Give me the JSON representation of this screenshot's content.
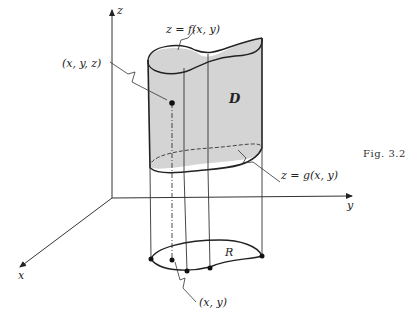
{
  "figure": {
    "caption": "Fig. 3.2",
    "axes": {
      "x_label": "x",
      "y_label": "y",
      "z_label": "z"
    },
    "region_label": "D",
    "base_region_label": "R",
    "top_surface_label": "z = f(x, y)",
    "bottom_surface_label": "z = g(x, y)",
    "point_3d_label": "(x, y, z)",
    "point_2d_label": "(x, y)",
    "colors": {
      "surface_fill": "#d4d4d4",
      "line": "#222222",
      "background": "#ffffff"
    }
  }
}
